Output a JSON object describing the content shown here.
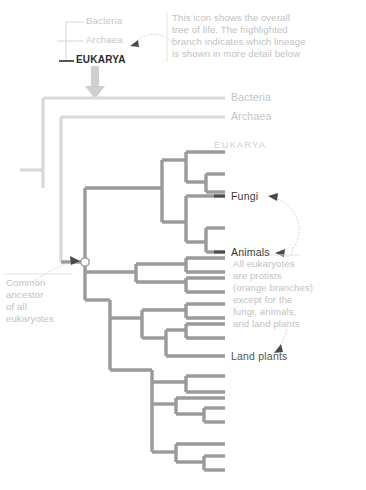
{
  "figure": {
    "type": "cladogram",
    "title_visible": false,
    "colors": {
      "background": "#ffffff",
      "branch_light": "#d9d9d9",
      "branch_protist": "#9a9a9a",
      "branch_highlight": "#5a5a5a",
      "annotation_text": "#c2c2c2",
      "label_light": "#c4c4c4",
      "label_dark": "#3b3b3b",
      "node_circle_stroke": "#9a9a9a",
      "arrow_fill": "#cfcfcf"
    }
  },
  "inset_icon": {
    "name": "tree-of-life-icon",
    "labels": [
      {
        "text": "Bacteria",
        "style": "light"
      },
      {
        "text": "Archaea",
        "style": "light"
      },
      {
        "text": "EUKARYA",
        "style": "highlighted"
      }
    ]
  },
  "annotations": [
    {
      "id": "icon-annotation",
      "lines": [
        "This icon shows the overall",
        "tree of life. The highlighted",
        "branch indicates which lineage",
        "is shown in more detail below"
      ]
    },
    {
      "id": "protist-annotation",
      "lines": [
        "All eukaryotes",
        "are protists",
        "(orange branches)",
        "except for the",
        "fungi, animals,",
        "and land plants"
      ]
    },
    {
      "id": "common-ancestor-annotation",
      "lines": [
        "Common",
        "ancestor",
        "of all",
        "eukaryotes"
      ]
    }
  ],
  "main_tree": {
    "tip_labels": [
      {
        "id": "bacteria",
        "text": "Bacteria",
        "emphasis": "light"
      },
      {
        "id": "archaea",
        "text": "Archaea",
        "emphasis": "light"
      },
      {
        "id": "eukarya",
        "text": "EUKARYA",
        "emphasis": "domain"
      },
      {
        "id": "fungi",
        "text": "Fungi",
        "emphasis": "dark"
      },
      {
        "id": "animals",
        "text": "Animals",
        "emphasis": "dark"
      },
      {
        "id": "land-plants",
        "text": "Land plants",
        "emphasis": "mid"
      }
    ],
    "node_markers": [
      {
        "id": "eukaryote-common-ancestor",
        "shape": "circle"
      }
    ]
  }
}
